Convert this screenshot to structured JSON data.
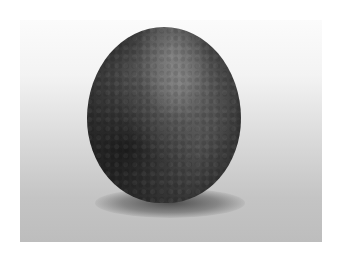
{
  "image": {
    "subject": "stone",
    "description": "Dark mottled egg-shaped stone on a light grey gradient background with a soft shadow beneath",
    "colors": {
      "background_top": "#fbfbfb",
      "background_bottom": "#bdbdbd",
      "stone_highlight": "#8a8a8a",
      "stone_base": "#4a4a4a",
      "stone_dark": "#1e1e1e"
    }
  }
}
